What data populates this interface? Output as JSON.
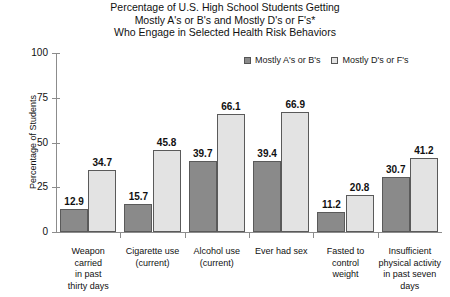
{
  "chart_data": {
    "type": "bar",
    "title": "Percentage of U.S. High School Students Getting Mostly A's or B's and Mostly D's or F's* Who Engage in Selected Health Risk Behaviors",
    "title_lines": [
      "Percentage of U.S. High School Students Getting",
      "Mostly A's or B's and Mostly D's or F's*",
      "Who Engage in Selected Health Risk Behaviors"
    ],
    "xlabel": "",
    "ylabel": "Percentage of Students",
    "ylim": [
      0,
      100
    ],
    "yticks": [
      0,
      25,
      50,
      75,
      100
    ],
    "ytick_labels": [
      "0",
      "25",
      "50",
      "75",
      "100"
    ],
    "grid": false,
    "legend_position": "top-right",
    "categories": [
      "Weapon carried in past thirty days",
      "Cigarette use (current)",
      "Alcohol use (current)",
      "Ever had sex",
      "Fasted to control weight",
      "Insufficient physical activity in past seven days"
    ],
    "category_lines": [
      [
        "Weapon",
        "carried",
        "in past",
        "thirty days"
      ],
      [
        "Cigarette use",
        "(current)"
      ],
      [
        "Alcohol use",
        "(current)"
      ],
      [
        "Ever had sex"
      ],
      [
        "Fasted to",
        "control",
        "weight"
      ],
      [
        "Insufficient",
        "physical activity",
        "in past seven",
        "days"
      ]
    ],
    "series": [
      {
        "name": "Mostly A's or B's",
        "color": "#8a8a8a",
        "values": [
          12.9,
          15.7,
          39.7,
          39.4,
          11.2,
          30.7
        ],
        "value_labels": [
          "12.9",
          "15.7",
          "39.7",
          "39.4",
          "11.2",
          "30.7"
        ]
      },
      {
        "name": "Mostly D's or F's",
        "color": "#e3e3e3",
        "values": [
          34.7,
          45.8,
          66.1,
          66.9,
          20.8,
          41.2
        ],
        "value_labels": [
          "34.7",
          "45.8",
          "66.1",
          "66.9",
          "20.8",
          "41.2"
        ]
      }
    ]
  },
  "colors": {
    "series_a": "#8a8a8a",
    "series_b": "#e3e3e3",
    "bar_border": "#5a5a5a",
    "axis": "#8c8c8c",
    "text": "#111111",
    "background": "#ffffff"
  }
}
